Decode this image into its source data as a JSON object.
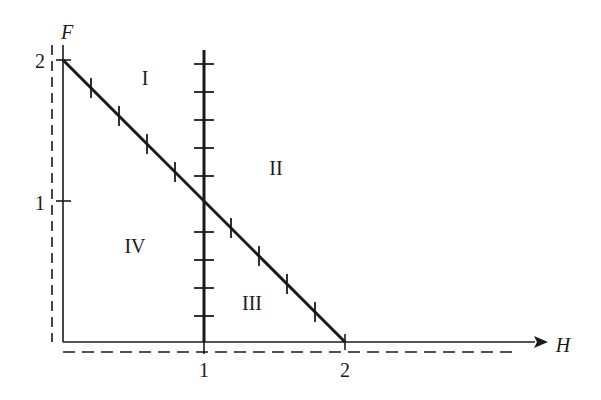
{
  "diagram": {
    "type": "region-plot",
    "axes": {
      "x_label": "H",
      "y_label": "F",
      "x_ticks": [
        "1",
        "2"
      ],
      "y_ticks": [
        "1",
        "2"
      ]
    },
    "regions": {
      "I": "I",
      "II": "II",
      "III": "III",
      "IV": "IV"
    },
    "lines": [
      {
        "name": "diagonal",
        "from": [
          0,
          2
        ],
        "to": [
          2,
          0
        ],
        "hatch_ticks": 7
      },
      {
        "name": "vertical-h1",
        "x": 1,
        "from_y": 0,
        "to_y": 2.1,
        "hatch_ticks": 10
      }
    ],
    "colors": {
      "ink": "#1a1a1a",
      "background": "#ffffff"
    }
  }
}
